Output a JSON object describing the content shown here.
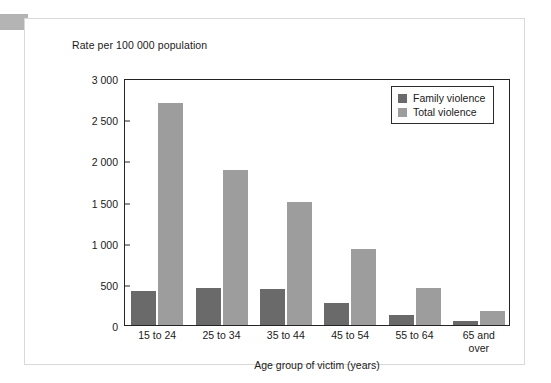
{
  "chart_data": {
    "type": "bar",
    "title": "",
    "ylabel": "Rate per 100 000 population",
    "xlabel": "Age group of victim (years)",
    "ylim": [
      0,
      3000
    ],
    "yticks": [
      0,
      500,
      1000,
      1500,
      2000,
      2500,
      3000
    ],
    "ytick_labels": [
      "0",
      "500",
      "1 000",
      "1 500",
      "2 000",
      "2 500",
      "3 000"
    ],
    "grid": false,
    "legend_position": "top-right",
    "categories": [
      "15 to 24",
      "25 to 34",
      "35 to 44",
      "45 to 54",
      "55 to 64",
      "65 and\nover"
    ],
    "category_labels": [
      {
        "line1": "15 to 24",
        "line2": ""
      },
      {
        "line1": "25 to 34",
        "line2": ""
      },
      {
        "line1": "35 to 44",
        "line2": ""
      },
      {
        "line1": "45 to 54",
        "line2": ""
      },
      {
        "line1": "55 to 64",
        "line2": ""
      },
      {
        "line1": "65 and",
        "line2": "over"
      }
    ],
    "series": [
      {
        "name": "Family violence",
        "color": "#6a6a6a",
        "values": [
          410,
          450,
          435,
          265,
          120,
          50
        ]
      },
      {
        "name": "Total violence",
        "color": "#9d9d9d",
        "values": [
          2700,
          1885,
          1490,
          920,
          445,
          175
        ]
      }
    ]
  },
  "legend": {
    "entries": [
      {
        "label": "Family violence",
        "color": "#6a6a6a"
      },
      {
        "label": "Total violence",
        "color": "#9d9d9d"
      }
    ]
  },
  "colors": {
    "family_violence": "#6a6a6a",
    "total_violence": "#9d9d9d",
    "axis": "#242424",
    "text": "#1a1a1a",
    "card_border": "#d9d9d9",
    "corner_block": "#b4b4b4"
  }
}
